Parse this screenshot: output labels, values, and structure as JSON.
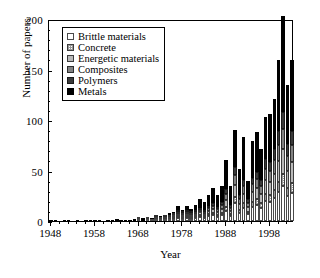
{
  "chart_data": {
    "type": "bar",
    "subtype": "stacked-bar",
    "title": "",
    "xlabel": "Year",
    "ylabel": "Number of papers",
    "xlim": [
      1947.5,
      2003.5
    ],
    "ylim": [
      0,
      200
    ],
    "ytick_labels": [
      "0",
      "50",
      "100",
      "150",
      "200"
    ],
    "ytick_values": [
      0,
      50,
      100,
      150,
      200
    ],
    "ytick_minor_step": 10,
    "xtick_labels": [
      "1948",
      "1958",
      "1968",
      "1978",
      "1988",
      "1998"
    ],
    "xtick_values": [
      1948,
      1958,
      1968,
      1978,
      1988,
      1998
    ],
    "xtick_minor_step": 2,
    "grid": false,
    "legend_position": "top-left",
    "categories": [
      1948,
      1949,
      1950,
      1951,
      1952,
      1953,
      1954,
      1955,
      1956,
      1957,
      1958,
      1959,
      1960,
      1961,
      1962,
      1963,
      1964,
      1965,
      1966,
      1967,
      1968,
      1969,
      1970,
      1971,
      1972,
      1973,
      1974,
      1975,
      1976,
      1977,
      1978,
      1979,
      1980,
      1981,
      1982,
      1983,
      1984,
      1985,
      1986,
      1987,
      1988,
      1989,
      1990,
      1991,
      1992,
      1993,
      1994,
      1995,
      1996,
      1997,
      1998,
      1999,
      2000,
      2001,
      2002,
      2003
    ],
    "series": [
      {
        "name": "Metals",
        "color": "#000000",
        "values": [
          1,
          1,
          0,
          1,
          1,
          0,
          1,
          0,
          1,
          1,
          1,
          1,
          0,
          1,
          1,
          2,
          1,
          1,
          1,
          2,
          2,
          3,
          2,
          2,
          3,
          3,
          2,
          4,
          4,
          7,
          5,
          6,
          5,
          7,
          10,
          9,
          11,
          15,
          12,
          16,
          28,
          19,
          36,
          26,
          42,
          18,
          36,
          39,
          30,
          42,
          48,
          50,
          70,
          95,
          59,
          70
        ]
      },
      {
        "name": "Polymers",
        "color": "#3a3a3a",
        "values": [
          0,
          0,
          0,
          0,
          0,
          0,
          0,
          0,
          0,
          0,
          0,
          0,
          0,
          0,
          0,
          0,
          0,
          0,
          0,
          0,
          0,
          0,
          0,
          0,
          0,
          0,
          0,
          0,
          0,
          1,
          1,
          1,
          1,
          1,
          2,
          2,
          2,
          3,
          2,
          3,
          5,
          3,
          8,
          4,
          6,
          4,
          6,
          7,
          6,
          9,
          8,
          11,
          14,
          17,
          12,
          14
        ]
      },
      {
        "name": "Composites",
        "color": "#828282",
        "values": [
          0,
          0,
          0,
          0,
          0,
          0,
          0,
          0,
          0,
          0,
          0,
          0,
          0,
          0,
          0,
          0,
          0,
          0,
          0,
          0,
          0,
          0,
          0,
          0,
          1,
          0,
          1,
          1,
          1,
          1,
          1,
          2,
          1,
          2,
          2,
          2,
          3,
          3,
          3,
          4,
          6,
          3,
          10,
          5,
          8,
          4,
          8,
          9,
          8,
          11,
          11,
          13,
          16,
          20,
          14,
          17
        ]
      },
      {
        "name": "Energetic materials",
        "color": "#b9b9b9",
        "values": [
          0,
          0,
          0,
          0,
          0,
          0,
          0,
          0,
          0,
          0,
          0,
          0,
          0,
          0,
          0,
          0,
          0,
          0,
          0,
          0,
          1,
          0,
          1,
          0,
          1,
          1,
          1,
          1,
          1,
          2,
          1,
          2,
          2,
          2,
          3,
          2,
          3,
          4,
          3,
          4,
          7,
          3,
          12,
          6,
          9,
          5,
          10,
          11,
          9,
          14,
          13,
          16,
          20,
          24,
          17,
          20
        ]
      },
      {
        "name": "Concrete",
        "color": "#cfcfcf",
        "values": [
          0,
          0,
          0,
          0,
          0,
          0,
          0,
          0,
          0,
          0,
          0,
          0,
          0,
          0,
          0,
          0,
          0,
          0,
          0,
          0,
          0,
          0,
          0,
          0,
          0,
          0,
          0,
          0,
          1,
          1,
          1,
          1,
          1,
          1,
          1,
          1,
          2,
          2,
          2,
          2,
          4,
          2,
          6,
          3,
          5,
          2,
          5,
          6,
          5,
          7,
          7,
          8,
          10,
          12,
          8,
          10
        ]
      },
      {
        "name": "Brittle materials",
        "color": "#ffffff",
        "values": [
          0,
          0,
          0,
          0,
          0,
          0,
          0,
          0,
          0,
          0,
          0,
          0,
          0,
          0,
          0,
          0,
          0,
          0,
          0,
          0,
          1,
          0,
          1,
          1,
          1,
          1,
          1,
          2,
          2,
          3,
          2,
          3,
          2,
          3,
          4,
          3,
          5,
          6,
          4,
          6,
          10,
          5,
          18,
          8,
          13,
          7,
          14,
          16,
          13,
          20,
          19,
          23,
          29,
          35,
          25,
          28
        ]
      }
    ]
  },
  "legend": {
    "items": [
      {
        "label": "Brittle materials",
        "swatch": "s-brittle"
      },
      {
        "label": "Concrete",
        "swatch": "s-concrete"
      },
      {
        "label": "Energetic materials",
        "swatch": "s-energetic"
      },
      {
        "label": "Composites",
        "swatch": "s-composites"
      },
      {
        "label": "Polymers",
        "swatch": "s-polymers"
      },
      {
        "label": "Metals",
        "swatch": "s-metals"
      }
    ]
  }
}
